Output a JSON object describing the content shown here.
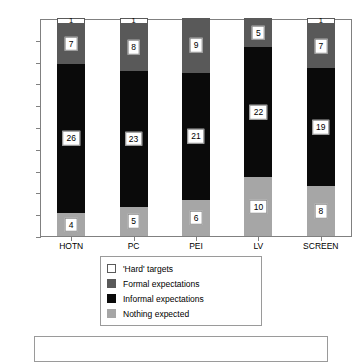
{
  "chart_data": {
    "type": "bar",
    "title": "",
    "subtitle": "",
    "xlabel": "",
    "ylabel": "",
    "stacked": true,
    "normalized": true,
    "grid": false,
    "legend_position": "bottom",
    "ylim": [
      0,
      100
    ],
    "y_tick_labels": [
      "0%",
      "10%",
      "20%",
      "30%",
      "40%",
      "50%",
      "60%",
      "70%",
      "80%",
      "90%",
      "100%"
    ],
    "y_tick_values": [
      0,
      10,
      20,
      30,
      40,
      50,
      60,
      70,
      80,
      90,
      100
    ],
    "categories": [
      "HOTN",
      "PC",
      "PEI",
      "LV",
      "SCREEN"
    ],
    "series": [
      {
        "name": "'Hard' targets",
        "color": "#ffffff",
        "values": [
          1,
          1,
          0,
          0,
          1
        ]
      },
      {
        "name": "Formal expectations",
        "color": "#595959",
        "values": [
          7,
          8,
          9,
          5,
          7
        ]
      },
      {
        "name": "Informal expectations",
        "color": "#0a0a0a",
        "values": [
          26,
          23,
          21,
          22,
          19
        ]
      },
      {
        "name": "Nothing expected",
        "color": "#a6a6a6",
        "values": [
          4,
          5,
          6,
          10,
          8
        ]
      }
    ],
    "column_totals": [
      38,
      37,
      36,
      37,
      35
    ]
  },
  "legend": {
    "items": [
      {
        "label": "'Hard' targets",
        "swatch": "white-swatch"
      },
      {
        "label": "Formal expectations",
        "swatch": "dark-gray-swatch"
      },
      {
        "label": "Informal expectations",
        "swatch": "black-swatch"
      },
      {
        "label": "Nothing expected",
        "swatch": "light-gray-swatch"
      }
    ]
  },
  "caption": {
    "text": ""
  },
  "colors": {
    "hard_targets": "#ffffff",
    "formal_expectations": "#595959",
    "informal_expectations": "#0a0a0a",
    "nothing_expected": "#a6a6a6",
    "axis": "#808080",
    "label_box_border": "#8c8c8c"
  }
}
